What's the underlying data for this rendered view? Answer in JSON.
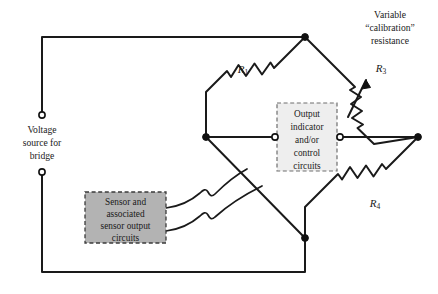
{
  "figure": {
    "type": "wheatstone-bridge-circuit-diagram",
    "background_color": "#ffffff",
    "wire_color": "#1a1a1a"
  },
  "labels": {
    "voltage_source": {
      "lines": [
        "Voltage",
        "source for",
        "bridge"
      ],
      "line1": "Voltage",
      "line2": "source for",
      "line3": "bridge"
    },
    "variable_resistance": {
      "lines": [
        "Variable",
        "“calibration”",
        "resistance"
      ],
      "line1": "Variable",
      "line2": "“calibration”",
      "line3": "resistance"
    }
  },
  "resistors": [
    {
      "name": "R1",
      "label": "R",
      "subscript": "1",
      "type": "fixed",
      "arm": "upper-left"
    },
    {
      "name": "R3",
      "label": "R",
      "subscript": "3",
      "type": "variable",
      "arm": "upper-right"
    },
    {
      "name": "R4",
      "label": "R",
      "subscript": "4",
      "type": "fixed",
      "arm": "lower-right"
    }
  ],
  "boxes": {
    "output": {
      "name": "output-indicator-box",
      "fill": "#eeeeee",
      "border": "#6e6e6e",
      "lines": [
        "Output",
        "indicator",
        "and/or",
        "control",
        "circuits"
      ],
      "line1": "Output",
      "line2": "indicator",
      "line3": "and/or",
      "line4": "control",
      "line5": "circuits"
    },
    "sensor": {
      "name": "sensor-box",
      "fill": "#b3b3b3",
      "border": "#3b3b3b",
      "lines": [
        "Sensor and",
        "associated",
        "sensor output",
        "circuits"
      ],
      "line1": "Sensor and",
      "line2": "associated",
      "line3": "sensor output",
      "line4": "circuits"
    }
  },
  "nodes": [
    {
      "name": "bridge-top-node",
      "x": 305,
      "y": 37,
      "style": "filled"
    },
    {
      "name": "bridge-left-node",
      "x": 206,
      "y": 137,
      "style": "filled"
    },
    {
      "name": "bridge-right-node",
      "x": 418,
      "y": 137,
      "style": "filled"
    },
    {
      "name": "bridge-bottom-node",
      "x": 305,
      "y": 238,
      "style": "filled"
    },
    {
      "name": "voltage-terminal-top",
      "x": 42,
      "y": 115,
      "style": "open"
    },
    {
      "name": "voltage-terminal-bottom",
      "x": 42,
      "y": 172,
      "style": "open"
    },
    {
      "name": "output-terminal-left",
      "x": 275,
      "y": 137,
      "style": "open"
    },
    {
      "name": "output-terminal-right",
      "x": 340,
      "y": 137,
      "style": "open"
    }
  ]
}
